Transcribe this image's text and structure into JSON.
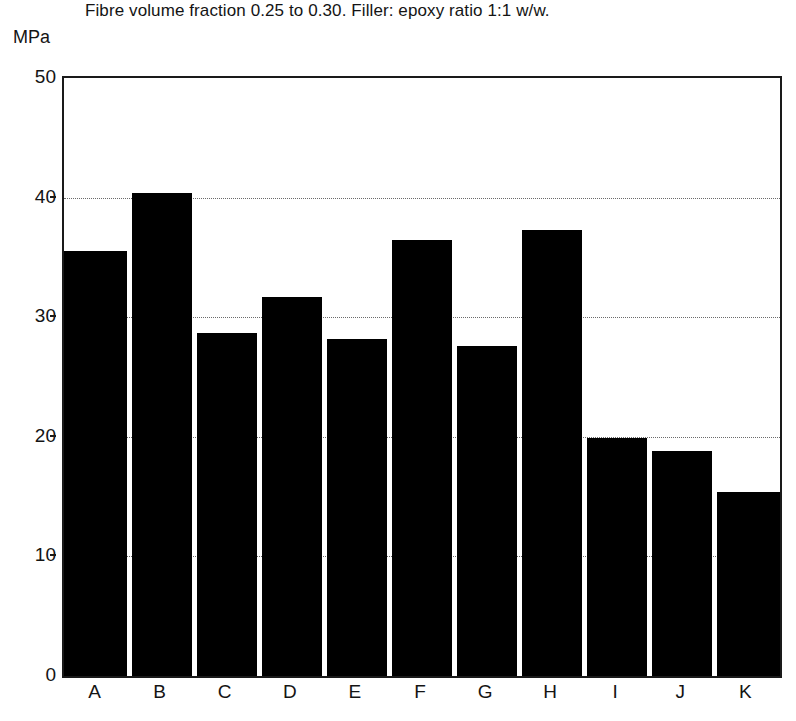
{
  "chart_data": {
    "type": "bar",
    "title": "Fibre volume fraction 0.25 to 0.30. Filler: epoxy ratio 1:1 w/w.",
    "subtitle": "",
    "unit_label": "MPa",
    "xlabel": "",
    "ylabel": "MPa",
    "categories": [
      "A",
      "B",
      "C",
      "D",
      "E",
      "F",
      "G",
      "H",
      "I",
      "J",
      "K"
    ],
    "values": [
      35.5,
      40.4,
      28.7,
      31.7,
      28.2,
      36.5,
      27.6,
      37.3,
      19.9,
      18.8,
      15.4
    ],
    "ylim": [
      0,
      50
    ],
    "yticks": [
      0,
      10,
      20,
      30,
      40,
      50
    ],
    "ytick_labels": [
      "0",
      "10",
      "20",
      "30",
      "40",
      "50"
    ],
    "gridlines": [
      10,
      20,
      30,
      40
    ],
    "grid": true,
    "grid_style": "dotted",
    "legend": false,
    "legend_position": "none",
    "bar_color": "#000000",
    "axis_color": "#1a1a1a",
    "grid_color": "#6b6b6b",
    "background_color": "#ffffff",
    "annotations": []
  }
}
